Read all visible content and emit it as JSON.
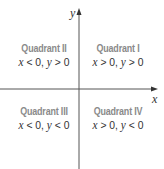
{
  "diagram": {
    "axes": {
      "x_label": "x",
      "y_label": "y",
      "line_color": "#555555"
    },
    "quadrants": [
      {
        "id": "II",
        "title": "Quadrant II",
        "cond_x": "x",
        "cond_x_rel": " < 0, ",
        "cond_y": "y",
        "cond_y_rel": " > 0"
      },
      {
        "id": "I",
        "title": "Quadrant I",
        "cond_x": "x",
        "cond_x_rel": " > 0, ",
        "cond_y": "y",
        "cond_y_rel": " > 0"
      },
      {
        "id": "III",
        "title": "Quadrant III",
        "cond_x": "x",
        "cond_x_rel": " < 0, ",
        "cond_y": "y",
        "cond_y_rel": " < 0"
      },
      {
        "id": "IV",
        "title": "Quadrant IV",
        "cond_x": "x",
        "cond_x_rel": " > 0, ",
        "cond_y": "y",
        "cond_y_rel": " < 0"
      }
    ],
    "title_color": "#8a8a8a",
    "text_color": "#333333"
  }
}
